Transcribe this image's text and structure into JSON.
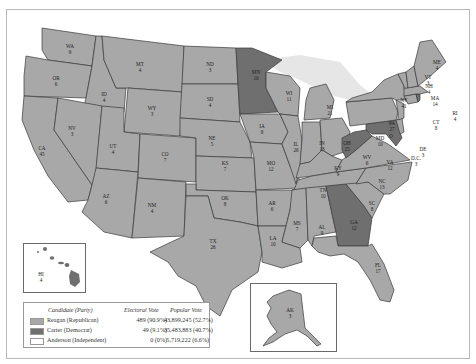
{
  "map": {
    "title": "1980 Presidential Election",
    "colors": {
      "republican": "#a8a8a8",
      "democrat": "#6f6f6f",
      "independent": "#ffffff",
      "lakes": "#e6e6e6"
    },
    "states": [
      {
        "abbr": "WA",
        "ev": "9",
        "winner": "rep"
      },
      {
        "abbr": "OR",
        "ev": "6",
        "winner": "rep"
      },
      {
        "abbr": "CA",
        "ev": "45",
        "winner": "rep"
      },
      {
        "abbr": "ID",
        "ev": "4",
        "winner": "rep"
      },
      {
        "abbr": "NV",
        "ev": "3",
        "winner": "rep"
      },
      {
        "abbr": "MT",
        "ev": "4",
        "winner": "rep"
      },
      {
        "abbr": "WY",
        "ev": "3",
        "winner": "rep"
      },
      {
        "abbr": "UT",
        "ev": "4",
        "winner": "rep"
      },
      {
        "abbr": "AZ",
        "ev": "6",
        "winner": "rep"
      },
      {
        "abbr": "CO",
        "ev": "7",
        "winner": "rep"
      },
      {
        "abbr": "NM",
        "ev": "4",
        "winner": "rep"
      },
      {
        "abbr": "ND",
        "ev": "3",
        "winner": "rep"
      },
      {
        "abbr": "SD",
        "ev": "4",
        "winner": "rep"
      },
      {
        "abbr": "NE",
        "ev": "5",
        "winner": "rep"
      },
      {
        "abbr": "KS",
        "ev": "7",
        "winner": "rep"
      },
      {
        "abbr": "OK",
        "ev": "8",
        "winner": "rep"
      },
      {
        "abbr": "TX",
        "ev": "26",
        "winner": "rep"
      },
      {
        "abbr": "MN",
        "ev": "10",
        "winner": "dem"
      },
      {
        "abbr": "IA",
        "ev": "8",
        "winner": "rep"
      },
      {
        "abbr": "MO",
        "ev": "12",
        "winner": "rep"
      },
      {
        "abbr": "AR",
        "ev": "6",
        "winner": "rep"
      },
      {
        "abbr": "LA",
        "ev": "10",
        "winner": "rep"
      },
      {
        "abbr": "WI",
        "ev": "11",
        "winner": "rep"
      },
      {
        "abbr": "IL",
        "ev": "26",
        "winner": "rep"
      },
      {
        "abbr": "MI",
        "ev": "21",
        "winner": "rep"
      },
      {
        "abbr": "IN",
        "ev": "13",
        "winner": "rep"
      },
      {
        "abbr": "OH",
        "ev": "25",
        "winner": "rep"
      },
      {
        "abbr": "KY",
        "ev": "9",
        "winner": "rep"
      },
      {
        "abbr": "TN",
        "ev": "10",
        "winner": "rep"
      },
      {
        "abbr": "MS",
        "ev": "7",
        "winner": "rep"
      },
      {
        "abbr": "AL",
        "ev": "9",
        "winner": "rep"
      },
      {
        "abbr": "GA",
        "ev": "12",
        "winner": "dem"
      },
      {
        "abbr": "FL",
        "ev": "17",
        "winner": "rep"
      },
      {
        "abbr": "SC",
        "ev": "8",
        "winner": "rep"
      },
      {
        "abbr": "NC",
        "ev": "13",
        "winner": "rep"
      },
      {
        "abbr": "VA",
        "ev": "12",
        "winner": "rep"
      },
      {
        "abbr": "WV",
        "ev": "6",
        "winner": "dem"
      },
      {
        "abbr": "MD",
        "ev": "10",
        "winner": "dem"
      },
      {
        "abbr": "DE",
        "ev": "3",
        "winner": "rep"
      },
      {
        "abbr": "D.C.",
        "ev": "3",
        "winner": "dem"
      },
      {
        "abbr": "PA",
        "ev": "27",
        "winner": "rep"
      },
      {
        "abbr": "NJ",
        "ev": "17",
        "winner": "rep"
      },
      {
        "abbr": "NY",
        "ev": "41",
        "winner": "rep"
      },
      {
        "abbr": "CT",
        "ev": "8",
        "winner": "rep"
      },
      {
        "abbr": "RI",
        "ev": "4",
        "winner": "dem"
      },
      {
        "abbr": "MA",
        "ev": "14",
        "winner": "rep"
      },
      {
        "abbr": "VT",
        "ev": "3",
        "winner": "rep"
      },
      {
        "abbr": "NH",
        "ev": "4",
        "winner": "rep"
      },
      {
        "abbr": "ME",
        "ev": "4",
        "winner": "rep"
      },
      {
        "abbr": "AK",
        "ev": "3",
        "winner": "rep"
      },
      {
        "abbr": "HI",
        "ev": "4",
        "winner": "dem"
      }
    ]
  },
  "legend": {
    "headers": {
      "candidate": "Candidate (Party)",
      "electoral": "Electoral Vote",
      "popular": "Popular Vote"
    },
    "rows": [
      {
        "candidate": "Reagan (Republican)",
        "electoral": "489 (90.9%)",
        "popular": "43,899,245 (52.7%)",
        "color": "#a8a8a8"
      },
      {
        "candidate": "Carter (Democrat)",
        "electoral": "49 (9.1%)",
        "popular": "35,483,883 (40.7%)",
        "color": "#6f6f6f"
      },
      {
        "candidate": "Anderson (Independent)",
        "electoral": "0 (0%)",
        "popular": "5,719,222 (6.6%)",
        "color": "#ffffff"
      }
    ]
  },
  "labels": {
    "WA": [
      "WA",
      "9"
    ],
    "OR": [
      "OR",
      "6"
    ],
    "CA": [
      "CA",
      "45"
    ],
    "ID": [
      "ID",
      "4"
    ],
    "NV": [
      "NV",
      "3"
    ],
    "MT": [
      "MT",
      "4"
    ],
    "WY": [
      "WY",
      "3"
    ],
    "UT": [
      "UT",
      "4"
    ],
    "AZ": [
      "AZ",
      "6"
    ],
    "CO": [
      "CO",
      "7"
    ],
    "NM": [
      "NM",
      "4"
    ],
    "ND": [
      "ND",
      "3"
    ],
    "SD": [
      "SD",
      "4"
    ],
    "NE": [
      "NE",
      "5"
    ],
    "KS": [
      "KS",
      "7"
    ],
    "OK": [
      "OK",
      "8"
    ],
    "TX": [
      "TX",
      "26"
    ],
    "MN": [
      "MN",
      "10"
    ],
    "IA": [
      "IA",
      "8"
    ],
    "MO": [
      "MO",
      "12"
    ],
    "AR": [
      "AR",
      "6"
    ],
    "LA": [
      "LA",
      "10"
    ],
    "WI": [
      "WI",
      "11"
    ],
    "IL": [
      "IL",
      "26"
    ],
    "MI": [
      "MI",
      "21"
    ],
    "IN": [
      "IN",
      "13"
    ],
    "OH": [
      "OH",
      "25"
    ],
    "KY": [
      "KY",
      "9"
    ],
    "TN": [
      "TN",
      "10"
    ],
    "MS": [
      "MS",
      "7"
    ],
    "AL": [
      "AL",
      "9"
    ],
    "GA": [
      "GA",
      "12"
    ],
    "FL": [
      "FL",
      "17"
    ],
    "SC": [
      "SC",
      "8"
    ],
    "NC": [
      "NC",
      "13"
    ],
    "VA": [
      "VA",
      "12"
    ],
    "WV": [
      "WV",
      "6"
    ],
    "MD": [
      "MD",
      "10"
    ],
    "DE": [
      "DE",
      "3"
    ],
    "DC": [
      "D.C.",
      "3"
    ],
    "PA": [
      "PA",
      "27"
    ],
    "NY": [
      "NY",
      "41"
    ],
    "CT": [
      "CT",
      "8"
    ],
    "RI": [
      "RI",
      "4"
    ],
    "MA": [
      "MA",
      "14"
    ],
    "VT": [
      "VT",
      "3"
    ],
    "NH": [
      "NH",
      "4"
    ],
    "ME": [
      "ME",
      "4"
    ],
    "AK": [
      "AK",
      "3"
    ],
    "HI": [
      "HI",
      "4"
    ]
  }
}
